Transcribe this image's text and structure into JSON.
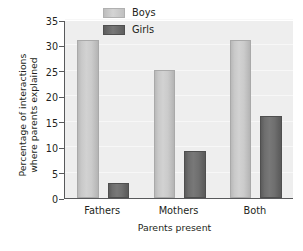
{
  "chart_data": {
    "type": "bar",
    "title": "",
    "xlabel": "Parents present",
    "ylabel": "Percentage of interactions where parents explained",
    "ylabel_line1": "Percentage of interactions",
    "ylabel_line2": "where parents explained",
    "categories": [
      "Fathers",
      "Mothers",
      "Both"
    ],
    "series": [
      {
        "name": "Boys",
        "color": "#cccccc",
        "values": [
          31,
          25.2,
          31
        ]
      },
      {
        "name": "Girls",
        "color": "#6e6e6e",
        "values": [
          3,
          9.2,
          16.2
        ]
      }
    ],
    "ylim": [
      0,
      35
    ],
    "yticks": [
      0,
      5,
      10,
      15,
      20,
      25,
      30,
      35
    ],
    "ytick_labels": [
      "0",
      "5",
      "10",
      "15",
      "20",
      "25",
      "30",
      "35"
    ],
    "grid": true,
    "grid_axis": "y",
    "legend_position": "upper center",
    "plot_background": "#eeeeee",
    "axis_color": "#58595b"
  }
}
